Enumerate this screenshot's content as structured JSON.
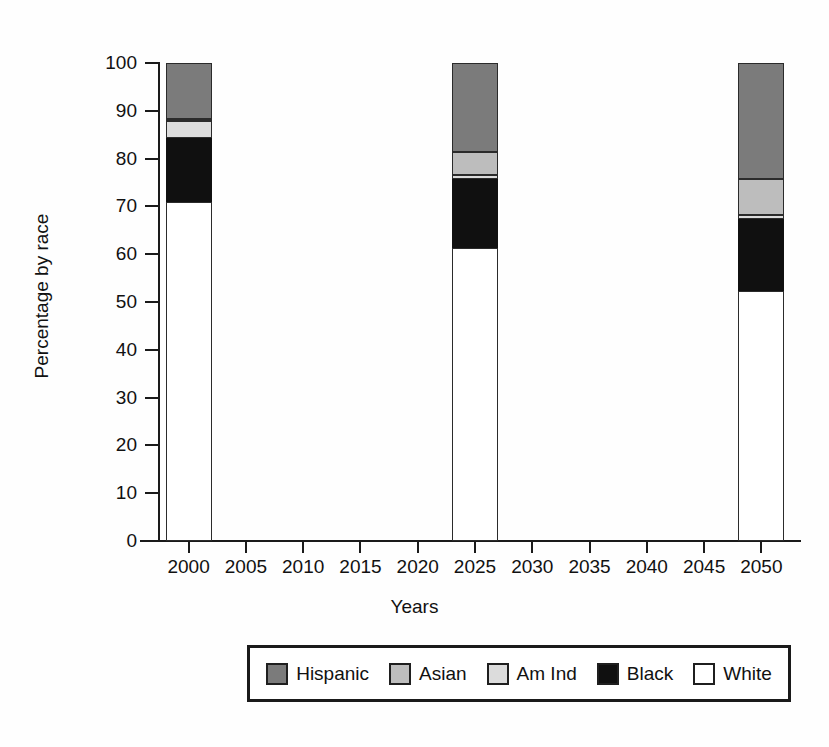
{
  "chart_data": {
    "type": "bar",
    "subtype": "stacked-bar",
    "title": "",
    "xlabel": "Years",
    "ylabel": "Percentage by race",
    "categories": [
      "2000",
      "2025",
      "2050"
    ],
    "xlim": [
      1997.5,
      2052.5
    ],
    "ylim": [
      0,
      100
    ],
    "yticks": [
      "100",
      "90",
      "80",
      "70",
      "60",
      "50",
      "40",
      "30",
      "20",
      "10",
      "0"
    ],
    "ytick_values": [
      100,
      90,
      80,
      70,
      60,
      50,
      40,
      30,
      20,
      10,
      0
    ],
    "xticks": [
      "2000",
      "2005",
      "2010",
      "2015",
      "2020",
      "2025",
      "2030",
      "2035",
      "2040",
      "2045",
      "2050"
    ],
    "xtick_values": [
      2000,
      2005,
      2010,
      2015,
      2020,
      2025,
      2030,
      2035,
      2040,
      2045,
      2050
    ],
    "grid": false,
    "legend_position": "below",
    "bar_width_years": 4.0,
    "series": [
      {
        "name": "White",
        "color": "#ffffff",
        "values": [
          71.0,
          61.3,
          52.3
        ],
        "cumulative_top": [
          71.0,
          61.3,
          52.3
        ]
      },
      {
        "name": "Black",
        "color": "#101010",
        "values": [
          13.3,
          14.5,
          15.0
        ],
        "cumulative_top": [
          84.3,
          75.8,
          67.3
        ]
      },
      {
        "name": "Am Ind",
        "color": "#dcdcdc",
        "values": [
          3.5,
          0.8,
          0.8
        ],
        "cumulative_top": [
          87.8,
          76.6,
          68.1
        ]
      },
      {
        "name": "Asian",
        "color": "#bdbdbd",
        "values": [
          0.4,
          4.7,
          7.7
        ],
        "cumulative_top": [
          88.2,
          81.3,
          75.8
        ]
      },
      {
        "name": "Hispanic",
        "color": "#7b7b7b",
        "values": [
          11.8,
          18.7,
          24.2
        ],
        "cumulative_top": [
          100.0,
          100.0,
          100.0
        ]
      }
    ]
  },
  "axes": {
    "y_title": "Percentage by race",
    "x_title": "Years",
    "y_tick_labels": [
      "100",
      "90",
      "80",
      "70",
      "60",
      "50",
      "40",
      "30",
      "20",
      "10",
      "0"
    ],
    "x_tick_labels": [
      "2000",
      "2005",
      "2010",
      "2015",
      "2020",
      "2025",
      "2030",
      "2035",
      "2040",
      "2045",
      "2050"
    ]
  },
  "legend": {
    "entries": [
      {
        "label": "Hispanic",
        "color": "#7b7b7b"
      },
      {
        "label": "Asian",
        "color": "#bdbdbd"
      },
      {
        "label": "Am Ind",
        "color": "#dcdcdc"
      },
      {
        "label": "Black",
        "color": "#101010"
      },
      {
        "label": "White",
        "color": "#ffffff"
      }
    ]
  },
  "colors": {
    "hispanic": "#7b7b7b",
    "asian": "#bdbdbd",
    "am_ind": "#dcdcdc",
    "black": "#101010",
    "white": "#ffffff",
    "axis": "#1a1a1a",
    "background": "#ffffff"
  }
}
